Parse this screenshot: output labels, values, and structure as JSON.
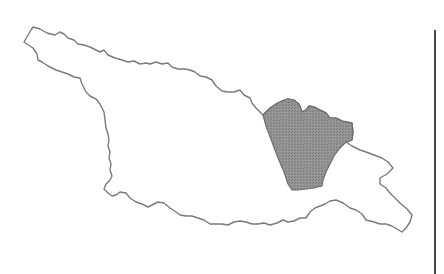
{
  "map": {
    "country_outline_color": "#7a7a7a",
    "highlighted_region_fill": "#8c8c8c",
    "highlighted_region_stroke": "#6e6e6e",
    "background": "#ffffff",
    "frame_rule_color": "#4a4a4a",
    "regions": [
      {
        "id": "country-outline",
        "highlighted": false
      },
      {
        "id": "highlighted-region",
        "highlighted": true
      }
    ]
  }
}
